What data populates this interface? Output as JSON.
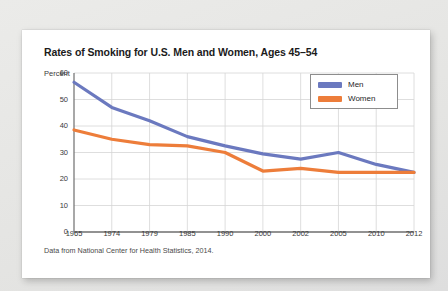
{
  "figure": {
    "title": "Rates of Smoking for U.S. Men and Women, Ages 45–54",
    "caption": "Data from National Center for Health Statistics, 2014.",
    "y_axis_label": "Percent"
  },
  "legend": {
    "position": "top-right",
    "entries": [
      {
        "label": "Men",
        "color": "#6b79bf"
      },
      {
        "label": "Women",
        "color": "#ed7d3a"
      }
    ]
  },
  "colors": {
    "men": "#6b79bf",
    "women": "#ed7d3a",
    "grid": "#d5d5d5",
    "axis": "#6e6e6e",
    "card": "#ffffff",
    "page_background": "#e7e7e5",
    "text": "#1b1b1b"
  },
  "chart_data": {
    "type": "line",
    "title": "Rates of Smoking for U.S. Men and Women, Ages 45–54",
    "xlabel": "",
    "ylabel": "Percent",
    "categories": [
      "1965",
      "1974",
      "1979",
      "1985",
      "1990",
      "2000",
      "2002",
      "2005",
      "2010",
      "2012"
    ],
    "series": [
      {
        "name": "Men",
        "color": "#6b79bf",
        "values": [
          56.5,
          47.0,
          42.0,
          36.0,
          32.5,
          29.5,
          27.5,
          30.0,
          25.5,
          22.5
        ]
      },
      {
        "name": "Women",
        "color": "#ed7d3a",
        "values": [
          38.5,
          35.0,
          33.0,
          32.5,
          30.0,
          23.0,
          24.0,
          22.5,
          22.5,
          22.5
        ]
      }
    ],
    "ylim": [
      0,
      60
    ],
    "yticks": [
      0,
      10,
      20,
      30,
      40,
      50,
      60
    ],
    "xticks": [
      "1965",
      "1974",
      "1979",
      "1985",
      "1990",
      "2000",
      "2002",
      "2005",
      "2010",
      "2012"
    ],
    "grid": true,
    "legend_position": "upper right",
    "source_note": "Data from National Center for Health Statistics, 2014."
  }
}
